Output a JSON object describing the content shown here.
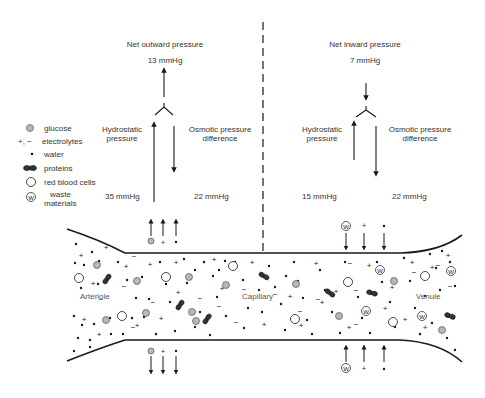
{
  "left_panel": {
    "title": "Net outward pressure",
    "net_value": "13 mmHg",
    "hydrostatic_label_1": "Hydrostatic",
    "hydrostatic_label_2": "pressure",
    "osmotic_label_1": "Osmotic pressure",
    "osmotic_label_2": "difference",
    "hydrostatic_value": "35 mmHg",
    "osmotic_value": "22 mmHg"
  },
  "right_panel": {
    "title": "Net inward pressure",
    "net_value": "7 mmHg",
    "hydrostatic_label_1": "Hydrostatic",
    "hydrostatic_label_2": "pressure",
    "osmotic_label_1": "Osmotic pressure",
    "osmotic_label_2": "difference",
    "hydrostatic_value": "15 mmHg",
    "osmotic_value": "22 mmHg"
  },
  "legend": {
    "items": [
      {
        "symbol": "glucose-icon",
        "label": "glucose"
      },
      {
        "symbol": "+, −",
        "label": "electrolytes"
      },
      {
        "symbol": "water-icon",
        "label": "water"
      },
      {
        "symbol": "protein-icon",
        "label": "proteins"
      },
      {
        "symbol": "red-blood-cell-icon",
        "label": "red blood cells"
      },
      {
        "symbol": "waste-icon",
        "label": "waste",
        "label2": "materials"
      }
    ]
  },
  "vessel": {
    "arteriole_label": "Arteriole",
    "capillary_label": "Capillary",
    "venule_label": "Venule",
    "waste_glyph": "W",
    "plus_glyph": "+",
    "minus_glyph": "−"
  },
  "colors": {
    "line": "#1a1a1a",
    "glucose_fill": "#b8b8b8",
    "protein_fill": "#333333",
    "text": "#333333"
  }
}
